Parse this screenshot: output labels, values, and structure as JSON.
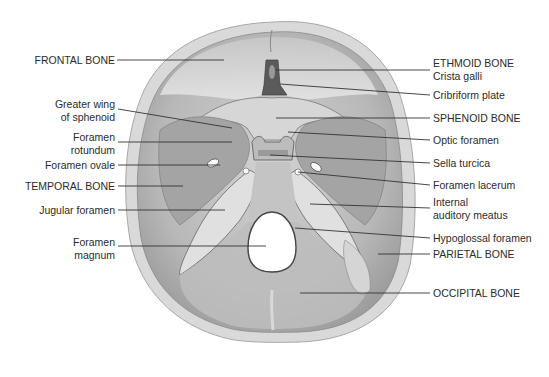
{
  "diagram": {
    "labels_left": [
      {
        "id": "frontal-bone",
        "lines": [
          "FRONTAL BONE"
        ]
      },
      {
        "id": "greater-wing",
        "lines": [
          "Greater wing",
          "of sphenoid"
        ]
      },
      {
        "id": "foramen-rotundum",
        "lines": [
          "Foramen",
          "rotundum"
        ]
      },
      {
        "id": "foramen-ovale",
        "lines": [
          "Foramen ovale"
        ]
      },
      {
        "id": "temporal-bone",
        "lines": [
          "TEMPORAL BONE"
        ]
      },
      {
        "id": "jugular-foramen",
        "lines": [
          "Jugular foramen"
        ]
      },
      {
        "id": "foramen-magnum",
        "lines": [
          "Foramen",
          "magnum"
        ]
      }
    ],
    "labels_right": [
      {
        "id": "ethmoid-bone",
        "lines": [
          "ETHMOID BONE",
          "Crista galli"
        ]
      },
      {
        "id": "cribriform-plate",
        "lines": [
          "Cribriform plate"
        ]
      },
      {
        "id": "sphenoid-bone",
        "lines": [
          "SPHENOID BONE"
        ]
      },
      {
        "id": "optic-foramen",
        "lines": [
          "Optic foramen"
        ]
      },
      {
        "id": "sella-turcica",
        "lines": [
          "Sella turcica"
        ]
      },
      {
        "id": "foramen-lacerum",
        "lines": [
          "Foramen lacerum"
        ]
      },
      {
        "id": "internal-auditory-meatus",
        "lines": [
          "Internal",
          "auditory meatus"
        ]
      },
      {
        "id": "hypoglossal-foramen",
        "lines": [
          "Hypoglossal foramen"
        ]
      },
      {
        "id": "parietal-bone",
        "lines": [
          "PARIETAL BONE"
        ]
      },
      {
        "id": "occipital-bone",
        "lines": [
          "OCCIPITAL BONE"
        ]
      }
    ],
    "colors": {
      "bone_rim": "#cfcfcf",
      "bone_fill": "#b9b9b9",
      "bone_light": "#dedede",
      "shadow": "#7a7a7a",
      "leader_line": "#333333",
      "text": "#2b2b2b"
    }
  }
}
